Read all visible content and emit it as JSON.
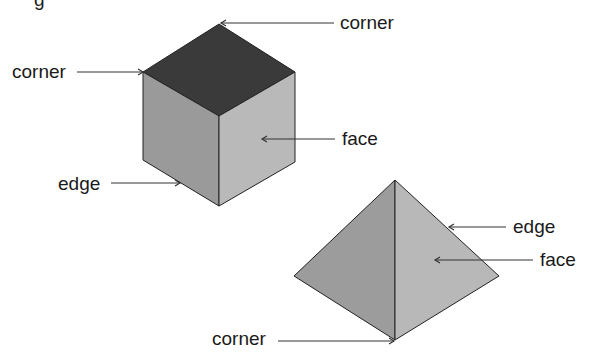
{
  "diagram": {
    "title_fragment": "g",
    "shapes": [
      {
        "name": "cube",
        "colors": {
          "top": "#3a3a3a",
          "left": "#9a9a9a",
          "right": "#b9b9b9"
        },
        "labels": {
          "top_corner": "corner",
          "left_corner": "corner",
          "face": "face",
          "edge": "edge"
        }
      },
      {
        "name": "pyramid",
        "colors": {
          "left": "#9c9c9c",
          "right": "#b8b8b8"
        },
        "labels": {
          "edge": "edge",
          "face": "face",
          "corner": "corner"
        }
      }
    ]
  }
}
